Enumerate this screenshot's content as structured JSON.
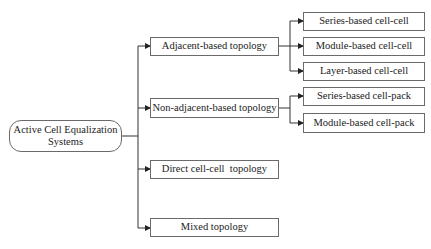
{
  "diagram": {
    "root": {
      "label": "Active Cell Equalization Systems",
      "line1": "Active Cell Equalization",
      "line2": "Systems"
    },
    "level1": [
      {
        "label": "Adjacent-based topology"
      },
      {
        "label": "Non-adjacent-based topology"
      },
      {
        "label": "Direct cell-cell  topology"
      },
      {
        "label": "Mixed topology"
      }
    ],
    "adjacent_children": [
      {
        "label": "Series-based cell-cell"
      },
      {
        "label": "Module-based cell-cell"
      },
      {
        "label": "Layer-based cell-cell"
      }
    ],
    "non_adjacent_children": [
      {
        "label": "Series-based cell-pack"
      },
      {
        "label": "Module-based cell-pack"
      }
    ],
    "colors": {
      "line": "#333333",
      "border": "#6a6a6a",
      "background": "#ffffff"
    }
  }
}
